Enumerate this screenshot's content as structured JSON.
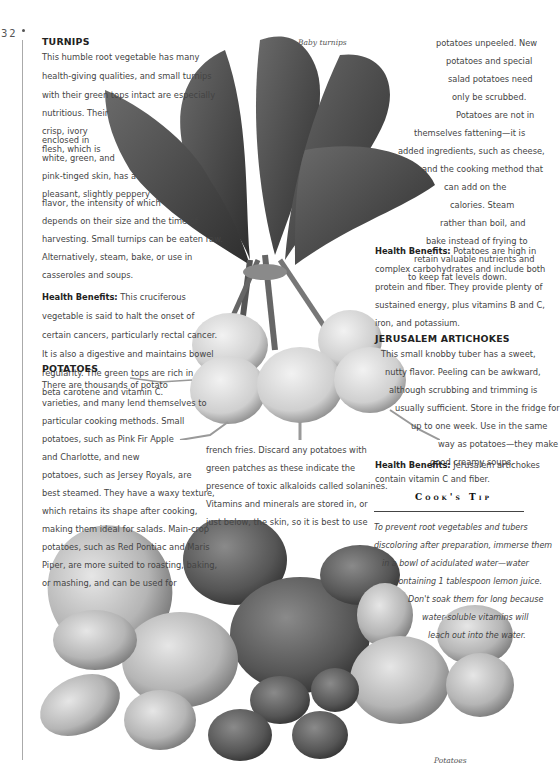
{
  "page": {
    "number": "32"
  },
  "captions": {
    "turnips": "Baby turnips",
    "potatoes": "Potatoes"
  },
  "turnips": {
    "heading": "TURNIPS",
    "lines": [
      "This humble root vegetable has many",
      "health-giving qualities, and small turnips",
      "with their green tops intact are especially",
      "nutritious. Their",
      "crisp, ivory",
      "flesh, which is",
      "enclosed in",
      "white, green, and",
      "pink-tinged skin, has a",
      "pleasant, slightly peppery",
      "flavor, the intensity of which",
      "depends on their size and the time of",
      "harvesting. Small turnips can be eaten raw.",
      "Alternatively, steam, bake, or use in",
      "casseroles and soups."
    ],
    "health_label": "Health Benefits:",
    "health_lines": [
      " This cruciferous",
      "vegetable is said to halt the onset of",
      "certain cancers, particularly rectal cancer.",
      "It is also a digestive and maintains bowel",
      "regularity. The green tops are rich in",
      "beta carotene and vitamin C."
    ]
  },
  "potatoes": {
    "heading": "POTATOES",
    "lines": [
      "There are thousands of potato",
      "varieties, and many lend themselves to",
      "particular cooking methods. Small",
      "potatoes, such as Pink Fir Apple",
      "and Charlotte, and new",
      "potatoes, such as Jersey Royals, are",
      "best steamed. They have a waxy texture,",
      "which retains its shape after cooking,",
      "making them ideal for salads. Main-crop",
      "potatoes, such as Red Pontiac and Maris",
      "Piper, are more suited to roasting, baking,",
      "or mashing, and can be used for"
    ],
    "middle_lines": [
      "french fries. Discard any potatoes with",
      "green patches as these indicate the",
      "presence of toxic alkaloids called solanines.",
      "   Vitamins and minerals are stored in, or",
      "just below, the skin, so it is best to use"
    ],
    "right_lines": [
      "potatoes unpeeled. New",
      "potatoes and special",
      "salad potatoes need",
      "only be scrubbed.",
      "Potatoes are not in",
      "themselves fattening—it is",
      "added ingredients, such as cheese,",
      "and the cooking method that",
      "can add on the",
      "calories. Steam",
      "rather than boil, and",
      "bake instead of frying to",
      "retain valuable nutrients and",
      "to keep fat levels down."
    ],
    "health_label": "Health Benefits:",
    "health_lines": [
      " Potatoes are high in",
      "complex carbohydrates and include both",
      "protein and fiber. They provide plenty of",
      "sustained energy, plus vitamins B and C,",
      "iron, and potassium."
    ]
  },
  "artichokes": {
    "heading": "JERUSALEM ARTICHOKES",
    "lines": [
      "This small knobby tuber has a sweet,",
      "nutty flavor. Peeling can be awkward,",
      "although scrubbing and trimming is",
      "usually sufficient. Store in the fridge for",
      "up to one week. Use in the same",
      "way as potatoes—they make",
      "good creamy soups."
    ],
    "health_label": "Health Benefits:",
    "health_lines": [
      " Jerusalem artichokes",
      "contain vitamin C and fiber."
    ]
  },
  "cooks_tip": {
    "title": "Cook's Tip",
    "lines": [
      "To prevent root vegetables and tubers",
      "discoloring after preparation, immerse them",
      "in a bowl of acidulated water—water",
      "containing 1 tablespoon lemon juice.",
      "Don't soak them for long because",
      "water-soluble vitamins will",
      "leach out into the water."
    ]
  },
  "colors": {
    "text": "#444444",
    "heading": "#222222",
    "rule": "#aaaaaa"
  }
}
